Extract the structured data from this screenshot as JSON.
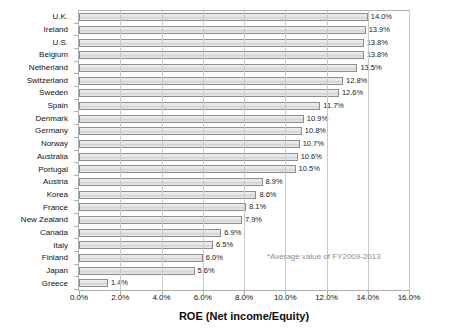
{
  "chart_data": {
    "type": "bar",
    "orientation": "horizontal",
    "title": "",
    "xlabel": "ROE (Net income/Equity)",
    "ylabel": "",
    "xlim": [
      0.0,
      16.0
    ],
    "xticks": [
      "0.0%",
      "2.0%",
      "4.0%",
      "6.0%",
      "8.0%",
      "10.0%",
      "12.0%",
      "14.0%",
      "16.0%"
    ],
    "xtick_values": [
      0.0,
      2.0,
      4.0,
      6.0,
      8.0,
      10.0,
      12.0,
      14.0,
      16.0
    ],
    "grid": true,
    "legend": false,
    "categories": [
      "U.K.",
      "Ireland",
      "U.S.",
      "Belgium",
      "Netherland",
      "Switzerland",
      "Sweden",
      "Spain",
      "Denmark",
      "Germany",
      "Norway",
      "Australia",
      "Portugal",
      "Austria",
      "Korea",
      "France",
      "New Zealand",
      "Canada",
      "Italy",
      "Finland",
      "Japan",
      "Greece"
    ],
    "values": [
      14.0,
      13.9,
      13.8,
      13.8,
      13.5,
      12.8,
      12.6,
      11.7,
      10.9,
      10.8,
      10.7,
      10.6,
      10.5,
      8.9,
      8.6,
      8.1,
      7.9,
      6.9,
      6.5,
      6.0,
      5.6,
      1.4
    ],
    "data_labels": [
      "14.0%",
      "13.9%",
      "13.8%",
      "13.8%",
      "13.5%",
      "12.8%",
      "12.6%",
      "11.7%",
      "10.9%",
      "10.8%",
      "10.7%",
      "10.6%",
      "10.5%",
      "8.9%",
      "8.6%",
      "8.1%",
      "7.9%",
      "6.9%",
      "6.5%",
      "6.0%",
      "5.6%",
      "1.4%"
    ],
    "annotations": [
      "*Average value of FY2009-2013"
    ],
    "colors": {
      "bar_fill": "#e3e3e3",
      "bar_border": "#8d8d8d",
      "grid": "#c9c9c9",
      "axis": "#b0b0b0",
      "text": "#111111",
      "note": "#8d8d8d"
    }
  },
  "note": "*Average value of FY2009-2013"
}
